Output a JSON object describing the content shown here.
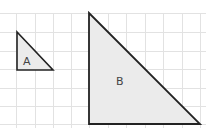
{
  "diagram": {
    "grid": {
      "spacing": 18.5,
      "color": "#e4e4e4"
    },
    "shapes": [
      {
        "label": "A",
        "type": "right-triangle",
        "fill": "#ececec",
        "stroke": "#222222"
      },
      {
        "label": "B",
        "type": "right-triangle",
        "fill": "#ececec",
        "stroke": "#222222"
      }
    ]
  }
}
